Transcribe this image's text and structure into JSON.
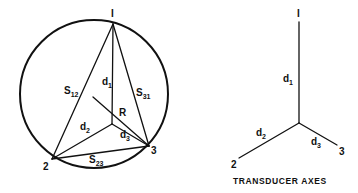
{
  "figure": {
    "left_diagram": {
      "vertices": [
        {
          "label": "I",
          "x": 113,
          "y": 24
        },
        {
          "label": "2",
          "x": 52,
          "y": 159
        },
        {
          "label": "3",
          "x": 149,
          "y": 146
        }
      ],
      "center": {
        "label": "R",
        "x": 112,
        "y": 124
      },
      "sides": {
        "s12": {
          "base": "S",
          "sub": "12"
        },
        "s31": {
          "base": "S",
          "sub": "31"
        },
        "s23": {
          "base": "S",
          "sub": "23"
        }
      },
      "distances": {
        "d1": {
          "base": "d",
          "sub": "1"
        },
        "d2": {
          "base": "d",
          "sub": "2"
        },
        "d3": {
          "base": "d",
          "sub": "3"
        }
      }
    },
    "right_diagram": {
      "axis_labels": {
        "a1": "I",
        "a2": "2",
        "a3": "3"
      },
      "distances": {
        "d1": {
          "base": "d",
          "sub": "1"
        },
        "d2": {
          "base": "d",
          "sub": "2"
        },
        "d3": {
          "base": "d",
          "sub": "3"
        }
      },
      "caption": "TRANSDUCER AXES"
    },
    "colors": {
      "ink": "#111111",
      "background": "#ffffff"
    }
  }
}
